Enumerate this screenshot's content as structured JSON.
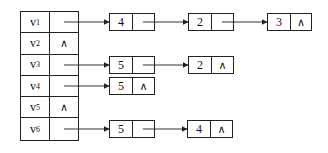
{
  "diagram": {
    "type": "adjacency_list",
    "null_symbol": "∧",
    "vertices": [
      {
        "name": "v",
        "sub": "1",
        "null": false,
        "list": [
          {
            "value": "4",
            "null": false
          },
          {
            "value": "2",
            "null": false
          },
          {
            "value": "3",
            "null": true
          }
        ]
      },
      {
        "name": "v",
        "sub": "2",
        "null": true,
        "list": []
      },
      {
        "name": "v",
        "sub": "3",
        "null": false,
        "list": [
          {
            "value": "5",
            "null": false
          },
          {
            "value": "2",
            "null": true
          }
        ]
      },
      {
        "name": "v",
        "sub": "4",
        "null": false,
        "list": [
          {
            "value": "5",
            "null": true
          }
        ]
      },
      {
        "name": "v",
        "sub": "5",
        "null": true,
        "list": []
      },
      {
        "name": "v",
        "sub": "6",
        "null": false,
        "list": [
          {
            "value": "5",
            "null": false
          },
          {
            "value": "4",
            "null": true
          }
        ]
      }
    ]
  }
}
